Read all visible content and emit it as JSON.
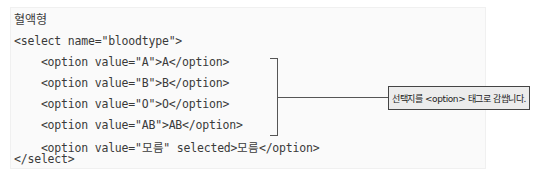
{
  "code_box": {
    "title": "혈액형",
    "lines": [
      "<select name=\"bloodtype\">",
      "    <option value=\"A\">A</option>",
      "    <option value=\"B\">B</option>",
      "    <option value=\"O\">O</option>",
      "    <option value=\"AB\">AB</option>",
      "    <option value=\"모름\" selected>모름</option>",
      "</select>"
    ]
  },
  "callout": {
    "text": "선택지를 <option> 태그로 감쌉니다."
  }
}
